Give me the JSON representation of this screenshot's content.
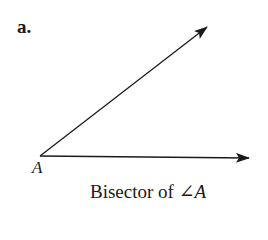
{
  "figure": {
    "part_label": "a.",
    "vertex_label": "A",
    "caption": {
      "text": "Bisector of ",
      "angle_symbol": "∠",
      "angle_name": "A"
    },
    "rays": [
      {
        "name": "upper-ray",
        "from": [
          40,
          156
        ],
        "to": [
          207,
          27
        ]
      },
      {
        "name": "lower-ray",
        "from": [
          40,
          156
        ],
        "to": [
          249,
          158
        ]
      }
    ],
    "stroke_color": "#1a1a1a"
  }
}
